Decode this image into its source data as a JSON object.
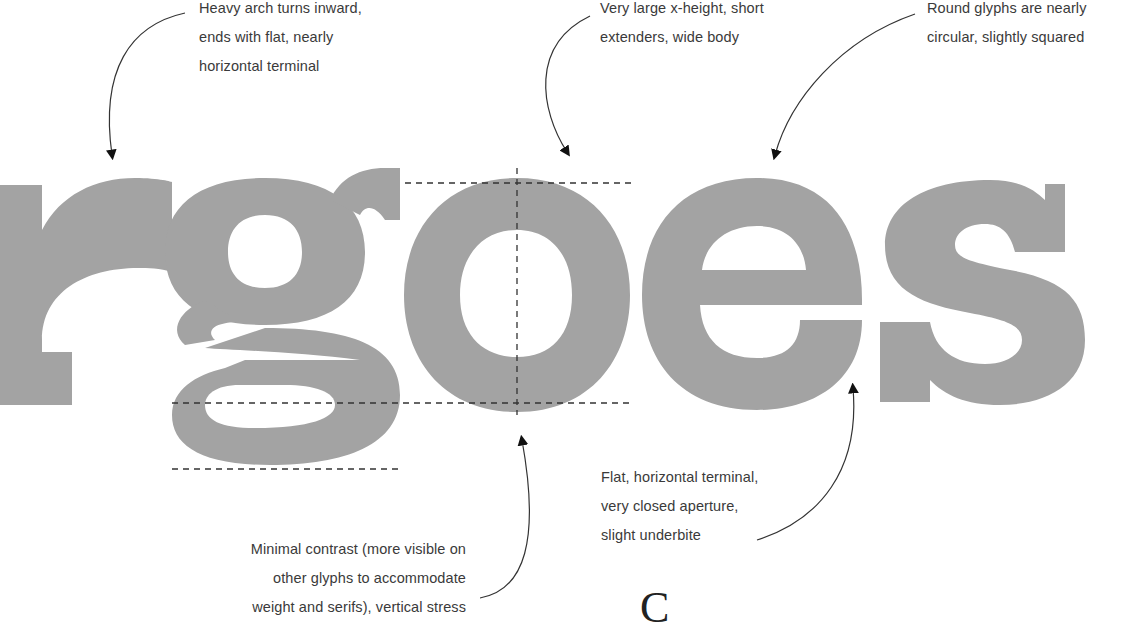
{
  "diagram": {
    "specimen_text": "rgoes",
    "glyph_color": "#a3a3a3",
    "guide_color": "#333333",
    "annotation_color": "#3a3a3a"
  },
  "annotations": {
    "arch": {
      "lines": [
        "Heavy arch turns inward,",
        "ends with flat, nearly",
        "horizontal terminal"
      ],
      "target_glyph": "r"
    },
    "xheight": {
      "lines": [
        "Very large x-height, short",
        "extenders, wide body"
      ],
      "target_glyph": "o"
    },
    "round": {
      "lines": [
        "Round glyphs are nearly",
        "circular, slightly squared"
      ],
      "target_glyph": "e"
    },
    "terminal": {
      "lines": [
        "Flat, horizontal terminal,",
        "very closed aperture,",
        "slight underbite"
      ],
      "target_glyph": "e"
    },
    "contrast": {
      "lines": [
        "Minimal contrast (more visible on",
        "other glyphs to accommodate",
        "weight and serifs), vertical stress"
      ],
      "target_glyph": "o"
    }
  },
  "footer_fragment": {
    "serif_letter": "C"
  }
}
